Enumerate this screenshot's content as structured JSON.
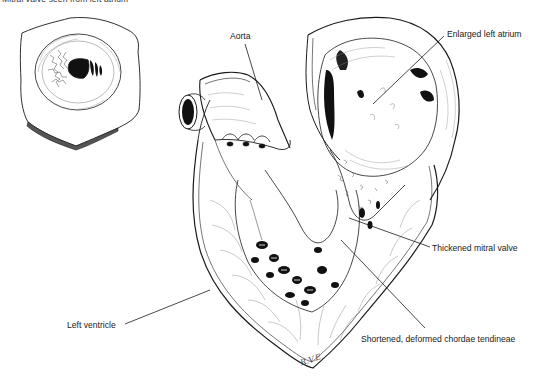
{
  "figure": {
    "caption": "Mitral valve seen from left atrium",
    "signature": "R.V.E.",
    "colors": {
      "ink": "#1a1a1a",
      "shade": "#555555",
      "background": "#ffffff"
    }
  },
  "inset": {
    "name": "mitral-valve-inset",
    "description": "Stenotic mitral valve orifice viewed from left atrium"
  },
  "labels": [
    {
      "id": "aorta",
      "text": "Aorta",
      "x": 230,
      "y": 31,
      "line": [
        245,
        44,
        262,
        100
      ]
    },
    {
      "id": "left-atrium",
      "text": "Enlarged left atrium",
      "x": 447,
      "y": 29,
      "line": [
        444,
        36,
        373,
        104
      ]
    },
    {
      "id": "mitral-valve",
      "text": "Thickened mitral valve",
      "x": 432,
      "y": 243,
      "line": [
        430,
        247,
        349,
        218
      ]
    },
    {
      "id": "chordae",
      "text": "Shortened, deformed chordae tendineae",
      "x": 361,
      "y": 334,
      "line": [
        425,
        328,
        341,
        240
      ]
    },
    {
      "id": "left-ventricle",
      "text": "Left ventricle",
      "x": 67,
      "y": 320,
      "line": [
        125,
        324,
        210,
        290
      ]
    }
  ]
}
